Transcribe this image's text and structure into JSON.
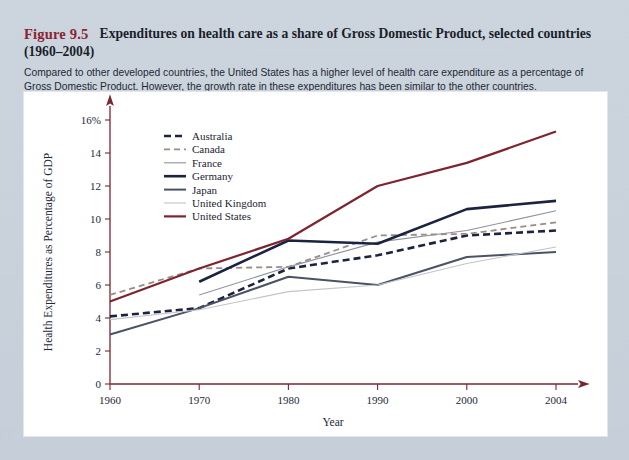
{
  "figure": {
    "label": "Figure 9.5",
    "title": "Expenditures on health care as a share of Gross Domestic Product, selected countries",
    "subtitle": "(1960–2004)",
    "caption": "Compared to other developed countries, the United States has a higher level of health care expenditure as a percentage of Gross Domestic Product. However, the growth rate in these expenditures has been similar to the other countries.",
    "label_color": "#8a2433"
  },
  "chart_data": {
    "type": "line",
    "title": "Expenditures on health care as a share of Gross Domestic Product, selected countries (1960–2004)",
    "xlabel": "Year",
    "ylabel": "Health Expenditures as Percentage of GDP",
    "x": [
      1960,
      1970,
      1980,
      1990,
      2000,
      2004
    ],
    "xticklabels": [
      "1960",
      "1970",
      "1980",
      "1990",
      "2000",
      "2004"
    ],
    "yticklabels": [
      "0",
      "2",
      "4",
      "6",
      "8",
      "10",
      "12",
      "14",
      "16%"
    ],
    "yticks": [
      0,
      2,
      4,
      6,
      8,
      10,
      12,
      14,
      16
    ],
    "ylim": [
      0,
      16
    ],
    "xlim": [
      1960,
      2004
    ],
    "grid": false,
    "legend_position": "upper-left-inside",
    "series": [
      {
        "name": "Australia",
        "color": "#1c2340",
        "style": "dashed",
        "width": 2.6,
        "x": [
          1960,
          1970,
          1980,
          1990,
          2000,
          2004
        ],
        "values": [
          4.1,
          4.6,
          7.0,
          7.8,
          9.0,
          9.3
        ]
      },
      {
        "name": "Canada",
        "color": "#9a8b83",
        "style": "dashed",
        "width": 1.8,
        "x": [
          1960,
          1970,
          1980,
          1990,
          2000,
          2004
        ],
        "values": [
          5.4,
          7.0,
          7.1,
          9.0,
          9.1,
          9.8
        ]
      },
      {
        "name": "France",
        "color": "#8f929c",
        "style": "solid",
        "width": 1.1,
        "x": [
          1970,
          1980,
          1990,
          2000,
          2004
        ],
        "values": [
          5.4,
          7.1,
          8.6,
          9.3,
          10.5
        ]
      },
      {
        "name": "Germany",
        "color": "#1c2340",
        "style": "solid",
        "width": 2.6,
        "x": [
          1970,
          1980,
          1990,
          2000,
          2004
        ],
        "values": [
          6.2,
          8.7,
          8.5,
          10.6,
          11.1
        ]
      },
      {
        "name": "Japan",
        "color": "#4c5265",
        "style": "solid",
        "width": 2.0,
        "x": [
          1960,
          1970,
          1980,
          1990,
          2000,
          2004
        ],
        "values": [
          3.0,
          4.6,
          6.5,
          6.0,
          7.7,
          8.0
        ]
      },
      {
        "name": "United Kingdom",
        "color": "#c2c4cb",
        "style": "solid",
        "width": 1.1,
        "x": [
          1960,
          1970,
          1980,
          1990,
          2000,
          2004
        ],
        "values": [
          3.9,
          4.5,
          5.6,
          6.0,
          7.3,
          8.3
        ]
      },
      {
        "name": "United States",
        "color": "#7d2430",
        "style": "solid",
        "width": 2.2,
        "x": [
          1960,
          1970,
          1980,
          1990,
          2000,
          2004
        ],
        "values": [
          5.0,
          7.0,
          8.8,
          12.0,
          13.4,
          15.3
        ]
      }
    ]
  },
  "axis_color": "#7d2430"
}
